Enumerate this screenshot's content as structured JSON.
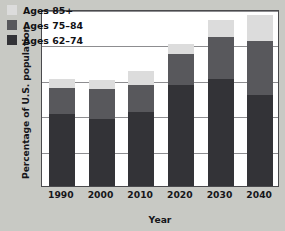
{
  "chart_data": {
    "type": "bar",
    "stacked": true,
    "title": "",
    "xlabel": "Year",
    "ylabel": "Percentage of U.S. population",
    "categories": [
      "1990",
      "2000",
      "2010",
      "2020",
      "2030",
      "2040"
    ],
    "series": [
      {
        "name": "Ages 62–74",
        "color": "#333337",
        "values": [
          10.2,
          9.5,
          10.5,
          14.3,
          15.1,
          12.9
        ]
      },
      {
        "name": "Ages 75–84",
        "color": "#58585c",
        "values": [
          3.6,
          4.2,
          3.8,
          4.4,
          5.9,
          7.6
        ]
      },
      {
        "name": "Ages 85+",
        "color": "#dcdcdc",
        "values": [
          1.3,
          1.3,
          2.0,
          1.3,
          2.4,
          3.6
        ]
      }
    ],
    "cumulative_tops": {
      "Ages 62–74": [
        10.2,
        9.5,
        10.5,
        14.3,
        15.1,
        12.9
      ],
      "Ages 75–84": [
        13.8,
        13.7,
        14.3,
        18.7,
        21.0,
        20.5
      ],
      "Ages 85+": [
        15.1,
        15.0,
        16.3,
        20.0,
        23.4,
        24.1
      ]
    },
    "ylim": [
      0,
      25
    ],
    "yticks": [
      0,
      5,
      10,
      15,
      20,
      25
    ],
    "ytick_labels": [
      "0",
      "5",
      "10",
      "15",
      "20",
      "25"
    ],
    "grid": "horizontal",
    "legend_position": "top-left",
    "legend_order": [
      "Ages 85+",
      "Ages 75–84",
      "Ages 62–74"
    ]
  },
  "legend": {
    "items": [
      {
        "label": "Ages 85+",
        "color": "#dcdcdc"
      },
      {
        "label": "Ages 75–84",
        "color": "#58585c"
      },
      {
        "label": "Ages 62–74",
        "color": "#333337"
      }
    ]
  },
  "colors": {
    "background": "#c8c9c4",
    "plot_background": "#ffffff",
    "frame": "#4a4a4d",
    "gridline": "#8d8d90",
    "text": "#16161a"
  }
}
